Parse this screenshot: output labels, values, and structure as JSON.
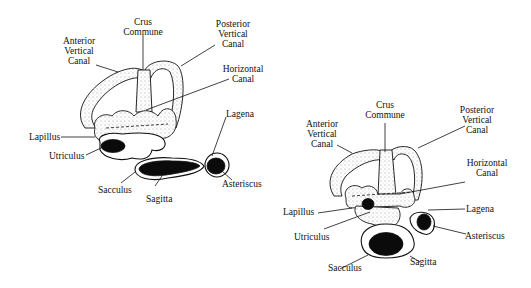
{
  "figures": [
    {
      "id": "left",
      "labels": {
        "crus_commune": [
          "Crus",
          "Commune"
        ],
        "anterior_vertical_canal": [
          "Anterior",
          "Vertical",
          "Canal"
        ],
        "posterior_vertical_canal": [
          "Posterior",
          "Vertical",
          "Canal"
        ],
        "horizontal_canal": [
          "Horizontal",
          "Canal"
        ],
        "lagena": "Lagena",
        "lapillus": "Lapillus",
        "utriculus": "Utriculus",
        "asteriscus": "Asteriscus",
        "sacculus": "Sacculus",
        "sagitta": "Sagitta"
      }
    },
    {
      "id": "right",
      "labels": {
        "crus_commune": [
          "Crus",
          "Commune"
        ],
        "anterior_vertical_canal": [
          "Anterior",
          "Vertical",
          "Canal"
        ],
        "posterior_vertical_canal": [
          "Posterior",
          "Vertical",
          "Canal"
        ],
        "horizontal_canal": [
          "Horizontal",
          "Canal"
        ],
        "lagena": "Lagena",
        "lapillus": "Lapillus",
        "utriculus": "Utriculus",
        "asteriscus": "Asteriscus",
        "sacculus": "Sacculus",
        "sagitta": "Sagitta"
      }
    }
  ],
  "colors": {
    "ink": "#111111",
    "background": "#ffffff",
    "otolith": "#0b0b0b"
  }
}
